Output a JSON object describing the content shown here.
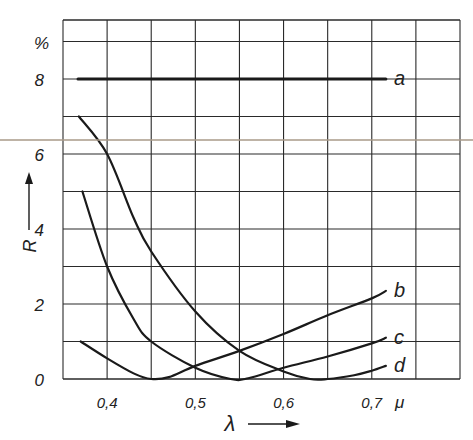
{
  "chart_data": {
    "type": "line",
    "title": "",
    "xlabel": "λ",
    "xunit": "μ",
    "ylabel": "R",
    "yunit": "%",
    "xlim": [
      0.35,
      0.8
    ],
    "ylim": [
      0,
      9.6
    ],
    "x_ticks": [
      0.4,
      0.5,
      0.6,
      0.7
    ],
    "x_tick_labels": [
      "0,4",
      "0,5",
      "0,6",
      "0,7"
    ],
    "y_ticks": [
      0,
      2,
      4,
      6,
      8
    ],
    "y_tick_labels": [
      "0",
      "2",
      "4",
      "6",
      "8"
    ],
    "grid": true,
    "grid_x_step": 0.05,
    "grid_y_step": 1,
    "legend_position": "inline labels at right end of curves",
    "series": [
      {
        "name": "a",
        "x": [
          0.367,
          0.716
        ],
        "y": [
          8,
          8
        ]
      },
      {
        "name": "b",
        "x": [
          0.37,
          0.4,
          0.43,
          0.45,
          0.47,
          0.5,
          0.55,
          0.6,
          0.65,
          0.7,
          0.716
        ],
        "y": [
          1.0,
          0.55,
          0.15,
          0.0,
          0.05,
          0.35,
          0.75,
          1.2,
          1.7,
          2.15,
          2.35
        ]
      },
      {
        "name": "c",
        "x": [
          0.372,
          0.4,
          0.43,
          0.45,
          0.5,
          0.54,
          0.56,
          0.6,
          0.65,
          0.7,
          0.716
        ],
        "y": [
          5.0,
          3.0,
          1.6,
          1.0,
          0.3,
          0.0,
          0.02,
          0.3,
          0.6,
          0.95,
          1.1
        ]
      },
      {
        "name": "d",
        "x": [
          0.368,
          0.4,
          0.43,
          0.45,
          0.5,
          0.55,
          0.6,
          0.63,
          0.65,
          0.68,
          0.7,
          0.716
        ],
        "y": [
          7.0,
          6.0,
          4.3,
          3.4,
          1.8,
          0.75,
          0.2,
          0.0,
          0.0,
          0.1,
          0.22,
          0.35
        ]
      }
    ],
    "curve_labels": {
      "a": "a",
      "b": "b",
      "c": "c",
      "d": "d"
    }
  },
  "axes": {
    "y_unit_label": "%",
    "y_axis_title": "R",
    "x_axis_title": "λ",
    "x_unit_label": "μ",
    "y_tick_labels": [
      "0",
      "2",
      "4",
      "6",
      "8"
    ],
    "x_tick_labels": [
      "0,4",
      "0,5",
      "0,6",
      "0,7"
    ]
  },
  "colors": {
    "ink": "#1a1a1a",
    "grid": "#2a2a2a",
    "artifact_line": "#a89a88",
    "background": "#ffffff"
  }
}
